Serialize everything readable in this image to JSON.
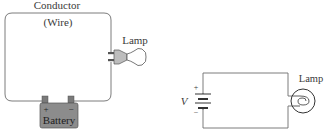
{
  "pictorial": {
    "conductor_label": "Conductor",
    "wire_label": "(Wire)",
    "lamp_label": "Lamp",
    "battery": {
      "label": "Battery",
      "plus": "+",
      "minus": "−",
      "color": "#8c8c8c"
    }
  },
  "schematic": {
    "voltage_label": "V",
    "plus": "+",
    "minus": "−",
    "lamp_label": "Lamp"
  },
  "colors": {
    "wire": "#6e6e6e",
    "text": "#3a3a3a"
  }
}
